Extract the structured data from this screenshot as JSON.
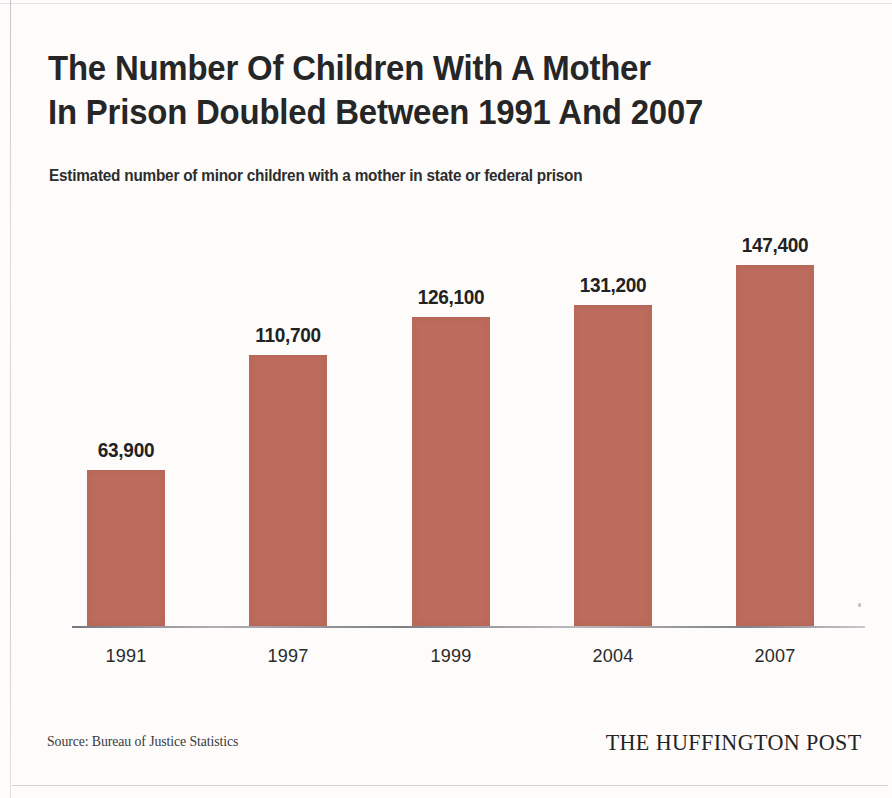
{
  "title": "The Number Of Children With A Mother\nIn Prison Doubled Between 1991 And 2007",
  "subtitle": "Estimated number of minor children with a mother in state or federal prison",
  "footer": {
    "source": "Source: Bureau of Justice Statistics",
    "brand": "THE HUFFINGTON POST"
  },
  "colors": {
    "bar": "#bc6b5c",
    "text": "#262626",
    "axis": "#5f5f69",
    "paper": "#fdfcfb"
  },
  "chart_data": {
    "type": "bar",
    "title": "The Number Of Children With A Mother In Prison Doubled Between 1991 And 2007",
    "subtitle": "Estimated number of minor children with a mother in state or federal prison",
    "xlabel": "",
    "ylabel": "",
    "categories": [
      "1991",
      "1997",
      "1999",
      "2004",
      "2007"
    ],
    "values": [
      63900,
      110700,
      126100,
      131200,
      147400
    ],
    "value_labels": [
      "63,900",
      "110,700",
      "126,100",
      "131,200",
      "147,400"
    ],
    "ylim": [
      0,
      160000
    ],
    "grid": false,
    "legend": false,
    "series": [
      {
        "name": "Estimated minor children with a mother in prison",
        "values": [
          63900,
          110700,
          126100,
          131200,
          147400
        ]
      }
    ]
  }
}
